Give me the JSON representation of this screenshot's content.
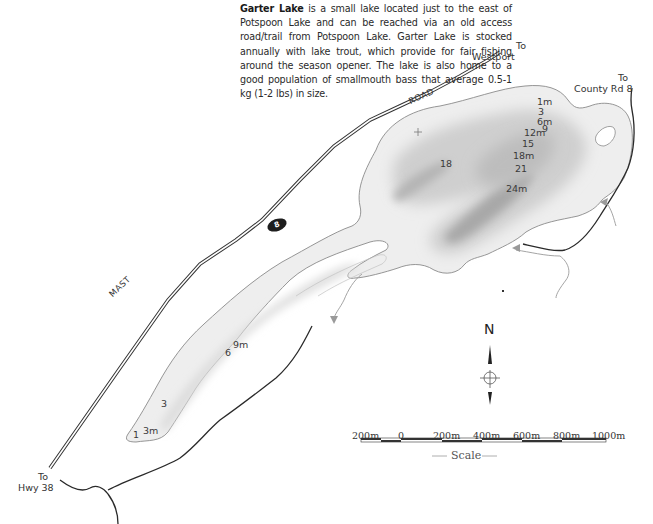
{
  "description": {
    "lake_name": "Garter Lake",
    "text": " is a small lake located just to the east of Potspoon Lake and can be reached via an old access road/trail from Potspoon Lake. Garter Lake is stocked annually with lake trout, which provide for fair fishing around the season opener. The lake is also home to a good population of smallmouth bass that average 0.5-1 kg (1-2 lbs) in size."
  },
  "road": {
    "name_part1": "MAST",
    "name_part2": "ROAD",
    "highway_badge": "8",
    "destinations": {
      "north": {
        "line1": "To",
        "line2": "Westport"
      },
      "east": {
        "line1": "To",
        "line2": "County Rd 8"
      },
      "south": {
        "line1": "To",
        "line2": "Hwy 38"
      }
    }
  },
  "depths": [
    {
      "label": "1m",
      "x": 537,
      "y": 97
    },
    {
      "label": "3",
      "x": 538,
      "y": 107
    },
    {
      "label": "6m",
      "x": 537,
      "y": 117
    },
    {
      "label": "9",
      "x": 542,
      "y": 124
    },
    {
      "label": "12m",
      "x": 524,
      "y": 128
    },
    {
      "label": "15",
      "x": 522,
      "y": 139
    },
    {
      "label": "18m",
      "x": 513,
      "y": 151
    },
    {
      "label": "21",
      "x": 515,
      "y": 164
    },
    {
      "label": "24m",
      "x": 506,
      "y": 184
    },
    {
      "label": "18",
      "x": 440,
      "y": 159
    },
    {
      "label": "9m",
      "x": 233,
      "y": 340
    },
    {
      "label": "6",
      "x": 225,
      "y": 348
    },
    {
      "label": "3",
      "x": 161,
      "y": 399
    },
    {
      "label": "1",
      "x": 133,
      "y": 430
    },
    {
      "label": "3m",
      "x": 143,
      "y": 426
    }
  ],
  "compass": {
    "label": "N"
  },
  "scale": {
    "title": "Scale",
    "ticks": [
      {
        "label": "200m",
        "x": 352
      },
      {
        "label": "0",
        "x": 398
      },
      {
        "label": "200m",
        "x": 433
      },
      {
        "label": "400m",
        "x": 473
      },
      {
        "label": "600m",
        "x": 513
      },
      {
        "label": "800m",
        "x": 553
      },
      {
        "label": "1000m",
        "x": 592
      }
    ]
  },
  "colors": {
    "shoreline": "#8a8a8a",
    "lake_shallow": "#ececec",
    "lake_mid": "#d6d6d6",
    "lake_deep": "#b8b8b8",
    "lake_deepest": "#9c9c9c",
    "road": "#333333",
    "trail": "#2a2a2a",
    "stream": "#9a9a9a"
  }
}
